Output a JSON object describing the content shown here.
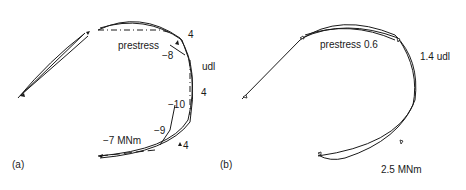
{
  "panel_a": {
    "caption": "(a)",
    "labels": {
      "prestress": "prestress",
      "udl": "udl",
      "m_top_right": "4",
      "m_mid_right": "4",
      "m_bottom_right": "4",
      "m_neg8": "−8",
      "m_neg10": "−10",
      "m_neg9": "−9",
      "m_neg7": "−7 MNm"
    }
  },
  "panel_b": {
    "caption": "(b)",
    "labels": {
      "prestress": "prestress 0.6",
      "udl": "1.4 udl",
      "moment": "2.5 MNm"
    }
  },
  "colors": {
    "line": "#1a1a1a",
    "background": "#ffffff"
  }
}
